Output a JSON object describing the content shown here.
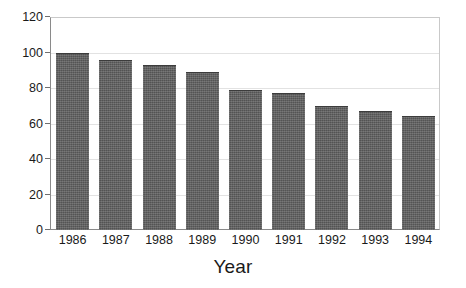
{
  "chart_data": {
    "type": "bar",
    "title": "",
    "xlabel": "Year",
    "ylabel": "",
    "categories": [
      "1986",
      "1987",
      "1988",
      "1989",
      "1990",
      "1991",
      "1992",
      "1993",
      "1994"
    ],
    "values": [
      100,
      96,
      93,
      89,
      79,
      77,
      70,
      67,
      64
    ],
    "ylim": [
      0,
      120
    ],
    "yticks": [
      0,
      20,
      40,
      60,
      80,
      100,
      120
    ],
    "ytick_labels": [
      "0",
      "20",
      "40",
      "60",
      "80",
      "100",
      "120"
    ],
    "grid": true,
    "legend": "none",
    "series": [
      {
        "name": "",
        "values": [
          100,
          96,
          93,
          89,
          79,
          77,
          70,
          67,
          64
        ]
      }
    ]
  },
  "style": {
    "bar_color": "#5d5d5d",
    "bar_edge_color": "#3c3c3c",
    "gridline_color": "#e2e2e2",
    "frame_color": "#c9c9c9",
    "axis_color": "#8a8a8a",
    "background": "#ffffff",
    "text_color": "#1a1a1a"
  }
}
